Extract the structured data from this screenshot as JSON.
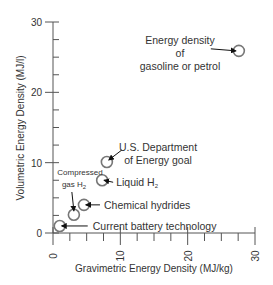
{
  "chart_data": {
    "type": "scatter",
    "title": "",
    "xlabel": "Gravimetric Energy Density (MJ/kg)",
    "ylabel": "Volumetric Energy Density (MJ/l)",
    "xlim": [
      0,
      30
    ],
    "ylim": [
      0,
      30
    ],
    "x_ticks": [
      0,
      10,
      20,
      30
    ],
    "y_ticks": [
      0,
      10,
      20,
      30
    ],
    "x_minor_step": 2.5,
    "y_minor_step": 2.5,
    "grid": false,
    "legend": null,
    "points": [
      {
        "name": "Current battery technology",
        "x": 1.0,
        "y": 1.0
      },
      {
        "name": "Compressed gas H2",
        "x": 3.1,
        "y": 2.6
      },
      {
        "name": "Chemical hydrides",
        "x": 4.6,
        "y": 4.0
      },
      {
        "name": "Liquid H2",
        "x": 7.3,
        "y": 7.5
      },
      {
        "name": "U.S. Department of Energy goal",
        "x": 8.0,
        "y": 10.1
      },
      {
        "name": "Energy density of gasoline or petrol",
        "x": 27.6,
        "y": 25.9
      }
    ],
    "annotations": [
      {
        "text": [
          "Current battery technology"
        ],
        "point": 0
      },
      {
        "text": [
          "Compressed",
          "gas H",
          "2"
        ],
        "point": 1
      },
      {
        "text": [
          "Chemical hydrides"
        ],
        "point": 2
      },
      {
        "text": [
          "Liquid H",
          "2"
        ],
        "point": 3
      },
      {
        "text": [
          "U.S. Department",
          "of Energy goal"
        ],
        "point": 4
      },
      {
        "text": [
          "Energy density",
          "of",
          "gasoline or petrol"
        ],
        "point": 5
      }
    ]
  },
  "colors": {
    "axis": "#555555",
    "marker": "#777777",
    "arrow": "#111111",
    "text": "#333333"
  }
}
